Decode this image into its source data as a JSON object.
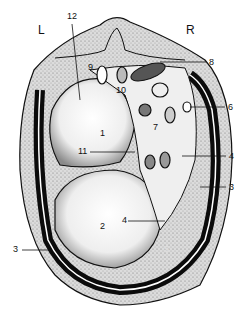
{
  "figure": {
    "type": "anatomical cross-section",
    "orientation": {
      "left": "L",
      "right": "R"
    },
    "colors": {
      "outline": "#111111",
      "stipple_fill": "#d8d8d8",
      "dark_fill": "#0b0b0b",
      "light_fill": "#f2f2f2",
      "background": "#ffffff"
    },
    "labels": [
      {
        "id": "1",
        "text": "1",
        "x": 100,
        "y": 134
      },
      {
        "id": "2",
        "text": "2",
        "x": 100,
        "y": 226
      },
      {
        "id": "3a",
        "text": "3",
        "x": 229,
        "y": 187
      },
      {
        "id": "3b",
        "text": "3",
        "x": 15,
        "y": 248
      },
      {
        "id": "4a",
        "text": "4",
        "x": 229,
        "y": 156
      },
      {
        "id": "4b",
        "text": "4",
        "x": 123,
        "y": 219
      },
      {
        "id": "5",
        "text": "5",
        "x": 164,
        "y": 249
      },
      {
        "id": "6",
        "text": "6",
        "x": 228,
        "y": 107
      },
      {
        "id": "7",
        "text": "7",
        "x": 153,
        "y": 127
      },
      {
        "id": "8",
        "text": "8",
        "x": 209,
        "y": 62
      },
      {
        "id": "9",
        "text": "9",
        "x": 88,
        "y": 67
      },
      {
        "id": "10",
        "text": "10",
        "x": 116,
        "y": 89
      },
      {
        "id": "11",
        "text": "11",
        "x": 83,
        "y": 150
      },
      {
        "id": "12",
        "text": "12",
        "x": 67,
        "y": 15
      }
    ],
    "side_labels": {
      "L": "L",
      "R": "R"
    }
  }
}
